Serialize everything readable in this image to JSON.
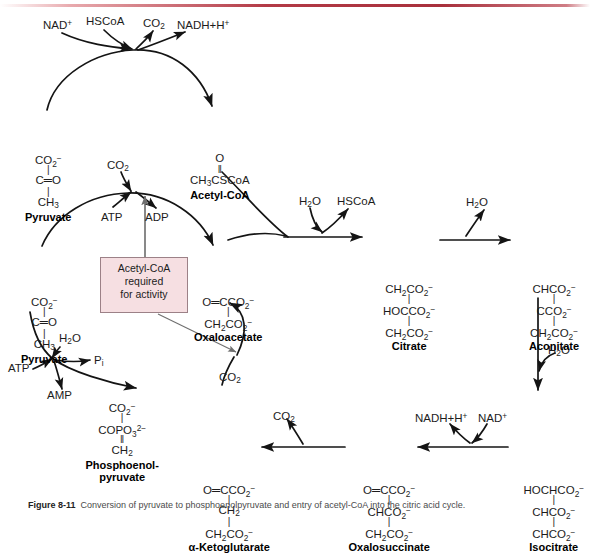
{
  "figure": {
    "top_rule_color": "#b33a46",
    "caption_prefix": "Figure 8-11",
    "caption_text": "Conversion of pyruvate to phosphoenolpyruvate and entry of acetyl-CoA into the citric acid cycle."
  },
  "callout": {
    "line1": "Acetyl-CoA",
    "line2": "required",
    "line3": "for activity",
    "fill": "#f6dfe2",
    "border": "#9c8187"
  },
  "compounds": [
    {
      "name": "Pyruvate",
      "id": "pyruvate-top",
      "x": 14,
      "y": 152,
      "formula": [
        "CO<sub>2</sub><sup>−</sup>",
        "|",
        "C═O",
        "|",
        "CH<sub>3</sub>"
      ]
    },
    {
      "name": "Acetyl-CoA",
      "id": "acetyl-coa",
      "x": 186,
      "y": 152,
      "formula": [
        "O",
        "‖",
        "CH<sub>3</sub>CSCoA"
      ]
    },
    {
      "name": "Pyruvate",
      "id": "pyruvate-bottom",
      "x": 10,
      "y": 294,
      "formula": [
        "CO<sub>2</sub><sup>−</sup>",
        "|",
        "C═O",
        "|",
        "CH<sub>3</sub>"
      ]
    },
    {
      "name": "Oxaloacetate",
      "id": "oxaloacetate",
      "x": 194,
      "y": 294,
      "formula": [
        "O═CCO<sub>2</sub><sup>−</sup>",
        "|",
        "CH<sub>2</sub>CO<sub>2</sub><sup>−</sup>"
      ]
    },
    {
      "name": "Citrate",
      "id": "citrate",
      "x": 375,
      "y": 281,
      "formula": [
        "CH<sub>2</sub>CO<sub>2</sub><sup>−</sup>",
        "|",
        "HOCCO<sub>2</sub><sup>−</sup>",
        "|",
        "CH<sub>2</sub>CO<sub>2</sub><sup>−</sup>"
      ]
    },
    {
      "name": "Aconitate",
      "id": "aconitate",
      "x": 520,
      "y": 281,
      "formula": [
        "CHCO<sub>2</sub><sup>−</sup>",
        "|",
        "CCO<sub>2</sub><sup>−</sup>",
        "|",
        "CH<sub>2</sub>CO<sub>2</sub><sup>−</sup>"
      ]
    },
    {
      "name": "Isocitrate",
      "id": "isocitrate",
      "x": 520,
      "y": 482,
      "formula": [
        "HOCHCO<sub>2</sub><sup>−</sup>",
        "|",
        "CHCO<sub>2</sub><sup>−</sup>",
        "|",
        "CHCO<sub>2</sub><sup>−</sup>"
      ]
    },
    {
      "name": "Oxalosuccinate",
      "id": "oxalosuccinate",
      "x": 355,
      "y": 482,
      "formula": [
        "O═CCO<sub>2</sub><sup>−</sup>",
        "|",
        "CHCO<sub>2</sub><sup>−</sup>",
        "|",
        "CH<sub>2</sub>CO<sub>2</sub><sup>−</sup>"
      ]
    },
    {
      "name": "α-Ketoglutarate",
      "id": "alpha-ketoglutarate",
      "x": 195,
      "y": 482,
      "formula": [
        "O═CCO<sub>2</sub><sup>−</sup>",
        "|",
        "CH<sub>2</sub>",
        "|",
        "CH<sub>2</sub>CO<sub>2</sub><sup>−</sup>"
      ]
    },
    {
      "name": "Phosphoenol-",
      "id": "phosphoenolpyruvate",
      "x": 88,
      "y": 400,
      "name2": "pyruvate",
      "formula": [
        "CO<sub>2</sub><sup>−</sup>",
        "|",
        "COPO<sub>3</sub><sup>2−</sup>",
        "‖",
        "CH<sub>2</sub>"
      ]
    }
  ],
  "cofactors": [
    {
      "id": "nad-plus-top",
      "text": "NAD<sup>+</sup>",
      "x": 43,
      "y": 19
    },
    {
      "id": "hscoa-top",
      "text": "HSCoA",
      "x": 86,
      "y": 15
    },
    {
      "id": "co2-top",
      "text": "CO<sub>2</sub>",
      "x": 143,
      "y": 17
    },
    {
      "id": "nadh-h-top",
      "text": "NADH+H<sup>+</sup>",
      "x": 177,
      "y": 19
    },
    {
      "id": "co2-pc",
      "text": "CO<sub>2</sub>",
      "x": 107,
      "y": 159
    },
    {
      "id": "atp-pc",
      "text": "ATP",
      "x": 101,
      "y": 211
    },
    {
      "id": "adp-pc",
      "text": "ADP",
      "x": 145,
      "y": 211
    },
    {
      "id": "h2o-cs",
      "text": "H<sub>2</sub>O",
      "x": 299,
      "y": 195
    },
    {
      "id": "hscoa-cs",
      "text": "HSCoA",
      "x": 337,
      "y": 195
    },
    {
      "id": "h2o-aconitase-1",
      "text": "H<sub>2</sub>O",
      "x": 466,
      "y": 196
    },
    {
      "id": "h2o-aconitase-2",
      "text": "H<sub>2</sub>O",
      "x": 548,
      "y": 344
    },
    {
      "id": "nadh-h-idh",
      "text": "NADH+H<sup>+</sup>",
      "x": 415,
      "y": 412
    },
    {
      "id": "nad-plus-idh",
      "text": "NAD<sup>+</sup>",
      "x": 478,
      "y": 412
    },
    {
      "id": "co2-akg",
      "text": "CO<sub>2</sub>",
      "x": 273,
      "y": 410
    },
    {
      "id": "co2-pepck",
      "text": "CO<sub>2</sub>",
      "x": 219,
      "y": 371
    },
    {
      "id": "h2o-pepck",
      "text": "H<sub>2</sub>O",
      "x": 59,
      "y": 332
    },
    {
      "id": "atp-pepck",
      "text": "ATP",
      "x": 8,
      "y": 362
    },
    {
      "id": "pi-pepck",
      "text": "P<sub>i</sub>",
      "x": 94,
      "y": 354
    },
    {
      "id": "amp-pepck",
      "text": "AMP",
      "x": 47,
      "y": 389
    }
  ],
  "arrows": {
    "stroke": "#141414",
    "callout_stroke": "#6f6f6f"
  }
}
